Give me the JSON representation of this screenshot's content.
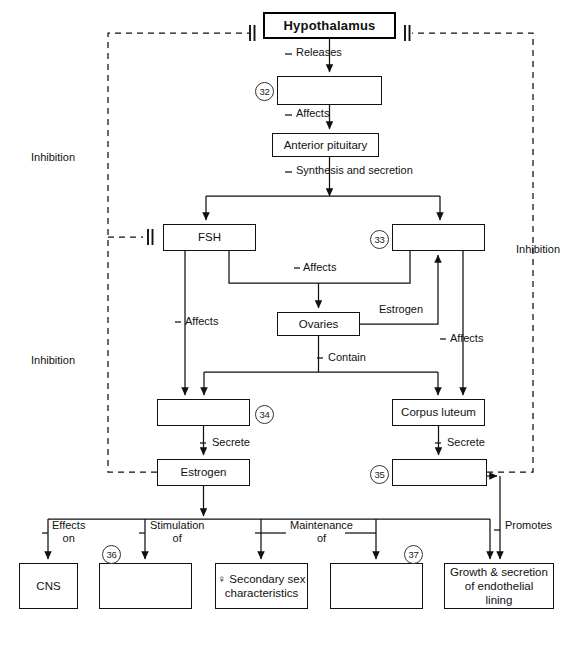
{
  "diagram": {
    "line_color": "#111111",
    "box_border_color": "#111111",
    "background": "#ffffff"
  },
  "nodes": {
    "hypothalamus": {
      "label": "Hypothalamus",
      "x": 263,
      "y": 12,
      "w": 133,
      "h": 27,
      "emphasis": "thick"
    },
    "box32": {
      "label": "",
      "x": 277,
      "y": 76,
      "w": 105,
      "h": 29,
      "emphasis": "normal"
    },
    "anterior_pituitary": {
      "label": "Anterior pituitary",
      "x": 272,
      "y": 133,
      "w": 107,
      "h": 24,
      "emphasis": "normal"
    },
    "fsh": {
      "label": "FSH",
      "x": 163,
      "y": 224,
      "w": 93,
      "h": 27,
      "emphasis": "normal"
    },
    "box33": {
      "label": "",
      "x": 392,
      "y": 224,
      "w": 93,
      "h": 27,
      "emphasis": "normal"
    },
    "ovaries": {
      "label": "Ovaries",
      "x": 277,
      "y": 312,
      "w": 83,
      "h": 24,
      "emphasis": "normal"
    },
    "box34": {
      "label": "",
      "x": 157,
      "y": 399,
      "w": 93,
      "h": 27,
      "emphasis": "normal"
    },
    "corpus_luteum": {
      "label": "Corpus luteum",
      "x": 392,
      "y": 399,
      "w": 93,
      "h": 27,
      "emphasis": "normal"
    },
    "estrogen": {
      "label": "Estrogen",
      "x": 157,
      "y": 459,
      "w": 93,
      "h": 27,
      "emphasis": "normal"
    },
    "box35": {
      "label": "",
      "x": 392,
      "y": 459,
      "w": 95,
      "h": 27,
      "emphasis": "normal"
    },
    "cns": {
      "label": "CNS",
      "x": 19,
      "y": 563,
      "w": 59,
      "h": 46,
      "emphasis": "normal"
    },
    "box36": {
      "label": "",
      "x": 99,
      "y": 563,
      "w": 93,
      "h": 46,
      "emphasis": "normal"
    },
    "secondary_sex": {
      "label": "♀ Secondary sex\ncharacteristics",
      "x": 215,
      "y": 563,
      "w": 93,
      "h": 46,
      "emphasis": "normal"
    },
    "box37": {
      "label": "",
      "x": 330,
      "y": 563,
      "w": 93,
      "h": 46,
      "emphasis": "normal"
    },
    "endothelial": {
      "label": "Growth & secretion\nof endothelial\nlining",
      "x": 444,
      "y": 563,
      "w": 110,
      "h": 46,
      "emphasis": "normal"
    }
  },
  "callout_numbers": [
    {
      "id": "n32",
      "value": "32",
      "x": 255,
      "y": 82
    },
    {
      "id": "n33",
      "value": "33",
      "x": 370,
      "y": 230
    },
    {
      "id": "n34",
      "value": "34",
      "x": 255,
      "y": 405
    },
    {
      "id": "n35",
      "value": "35",
      "x": 370,
      "y": 465
    },
    {
      "id": "n36",
      "value": "36",
      "x": 102,
      "y": 545
    },
    {
      "id": "n37",
      "value": "37",
      "x": 404,
      "y": 545
    }
  ],
  "edge_labels": [
    {
      "id": "releases",
      "text": "Releases",
      "x": 296,
      "y": 51
    },
    {
      "id": "affects1",
      "text": "Affects",
      "x": 296,
      "y": 112
    },
    {
      "id": "synthesis",
      "text": "Synthesis and secretion",
      "x": 296,
      "y": 169
    },
    {
      "id": "affects2",
      "text": "Affects",
      "x": 303,
      "y": 265
    },
    {
      "id": "affects3",
      "text": "Affects",
      "x": 185,
      "y": 319
    },
    {
      "id": "estrogen_edge",
      "text": "Estrogen",
      "x": 379,
      "y": 307
    },
    {
      "id": "affects4",
      "text": "Affects",
      "x": 450,
      "y": 336
    },
    {
      "id": "contain",
      "text": "Contain",
      "x": 328,
      "y": 355
    },
    {
      "id": "secrete1",
      "text": "Secrete",
      "x": 212,
      "y": 440
    },
    {
      "id": "secrete2",
      "text": "Secrete",
      "x": 447,
      "y": 440
    },
    {
      "id": "inhibition_left_top",
      "text": "Inhibition",
      "x": 76,
      "y": 156
    },
    {
      "id": "inhibition_left_bottom",
      "text": "Inhibition",
      "x": 76,
      "y": 359
    },
    {
      "id": "inhibition_right",
      "text": "Inhibition",
      "x": 516,
      "y": 248
    },
    {
      "id": "effects_on",
      "text": "Effects\non",
      "x": 57,
      "y": 525
    },
    {
      "id": "stimulation_of",
      "text": "Stimulation\nof",
      "x": 162,
      "y": 525
    },
    {
      "id": "maintenance_of",
      "text": "Maintenance\nof",
      "x": 302,
      "y": 525
    },
    {
      "id": "promotes",
      "text": "Promotes",
      "x": 510,
      "y": 524
    }
  ],
  "legend_note": {
    "inhibition_symbol": "double-bar blocked-arrow terminator",
    "dashed_lines_mean": "Inhibition (negative feedback)"
  }
}
